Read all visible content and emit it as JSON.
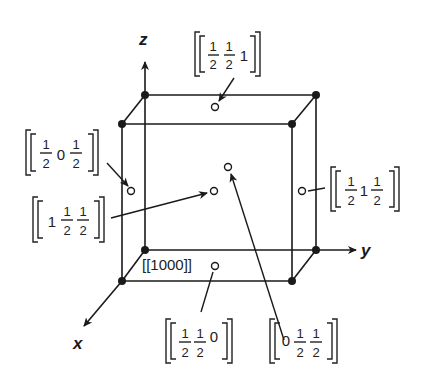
{
  "figure": {
    "type": "unit-cell-diagram",
    "axes": {
      "x": "x",
      "y": "y",
      "z": "z"
    },
    "cell_corners": 8,
    "points": [
      {
        "id": "face_top",
        "label": "[[½½1]]",
        "coords": [
          "1/2",
          "1/2",
          "1"
        ]
      },
      {
        "id": "face_left",
        "label": "[[½0½]]",
        "coords": [
          "1/2",
          "0",
          "1/2"
        ]
      },
      {
        "id": "face_front",
        "label": "[[1½½]]",
        "coords": [
          "1",
          "1/2",
          "1/2"
        ]
      },
      {
        "id": "face_back",
        "label": "[[0½½]]",
        "coords": [
          "0",
          "1/2",
          "1/2"
        ]
      },
      {
        "id": "face_right",
        "label": "[[½1½]]",
        "coords": [
          "1/2",
          "1",
          "1/2"
        ]
      },
      {
        "id": "face_bottom",
        "label": "[[½½0]]",
        "coords": [
          "1/2",
          "1/2",
          "0"
        ]
      }
    ],
    "origin_label": "[[1000]]",
    "fraction_num": "1",
    "fraction_den": "2",
    "digits": {
      "zero": "0",
      "one": "1"
    }
  }
}
